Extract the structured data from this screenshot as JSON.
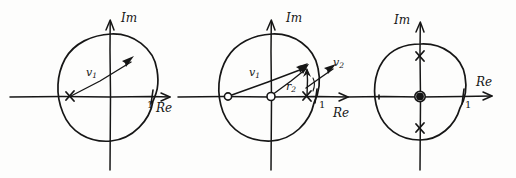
{
  "figure": {
    "style": "hand-drawn pen sketch",
    "ink_color": "#161616",
    "background_color": "#fdfdfc",
    "panel_count": 3
  },
  "panels": [
    {
      "id": "panel-1",
      "axis_labels": {
        "imaginary": "Im",
        "real": "Re"
      },
      "real_tick_label": "1",
      "vectors": [
        {
          "name": "v1",
          "label": "v",
          "subscript": "1",
          "from": "left-crossing-point",
          "to": "upper-right-on-circle"
        }
      ],
      "markers": [
        {
          "type": "x",
          "on": "real-axis-left",
          "label": ""
        }
      ],
      "circle": "unit circle centered at origin"
    },
    {
      "id": "panel-2",
      "axis_labels": {
        "imaginary": "Im",
        "real": "Re"
      },
      "real_tick_label": "1",
      "vectors": [
        {
          "name": "v1",
          "label": "v",
          "subscript": "1",
          "from": "open-circle-left-on-real-axis",
          "to": "point-on-circle-upper-right"
        },
        {
          "name": "r2",
          "label": "r",
          "subscript": "2",
          "from": "origin-open-circle",
          "to": "point-on-circle-upper-right"
        },
        {
          "name": "v2",
          "label": "v",
          "subscript": "2",
          "from": "near-real-axis-x-mark",
          "to": "outside-circle-upper-right"
        }
      ],
      "markers": [
        {
          "type": "open-circle",
          "on": "real-axis-left"
        },
        {
          "type": "open-circle",
          "on": "origin"
        },
        {
          "type": "x",
          "on": "real-axis-near-one"
        }
      ],
      "circle": "unit circle centered at origin"
    },
    {
      "id": "panel-3",
      "axis_labels": {
        "imaginary": "Im",
        "real": "Re"
      },
      "real_tick_label": "1",
      "vectors": [],
      "markers": [
        {
          "type": "x",
          "on": "imaginary-axis-upper"
        },
        {
          "type": "x",
          "on": "imaginary-axis-lower"
        },
        {
          "type": "filled-circled-dot",
          "on": "origin"
        }
      ],
      "circle": "unit circle centered at origin"
    }
  ]
}
